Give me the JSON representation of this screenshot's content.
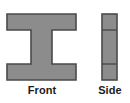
{
  "figure": {
    "title": "",
    "background_color": "#ffffff",
    "shape_fill_color": "#8c8c8c",
    "shape_stroke_color": "#4a4a4a",
    "label_color": "#1c1c1c",
    "views": [
      {
        "name": "front",
        "label": "Front",
        "shape": "i-beam",
        "description": "I-beam cross section: wide top flange, narrow central web, wide bottom flange",
        "geometry": {
          "x": 6,
          "y": 13,
          "width": 71,
          "height": 68,
          "flange_height": 16,
          "web_width": 21,
          "web_left_inset": 25
        }
      },
      {
        "name": "side",
        "label": "Side",
        "shape": "segmented-bar",
        "description": "Narrow vertical rectangle divided into three stacked segments by two horizontal lines",
        "geometry": {
          "x": 101,
          "y": 13,
          "width": 17,
          "height": 68,
          "divider_offsets": [
            16,
            50
          ]
        }
      }
    ]
  }
}
